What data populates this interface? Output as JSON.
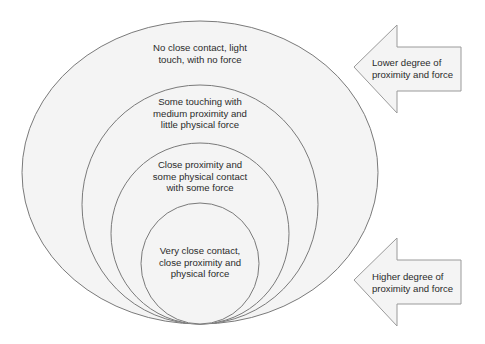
{
  "diagram": {
    "type": "nested-ellipses",
    "colors": {
      "fill": "#f3f3f3",
      "stroke": "#7a7a7a",
      "text": "#2b2b2b"
    },
    "rings": [
      {
        "label_lines": [
          "No close contact, light",
          "touch, with no force"
        ]
      },
      {
        "label_lines": [
          "Some touching with",
          "medium proximity and",
          "little physical force"
        ]
      },
      {
        "label_lines": [
          "Close proximity and",
          "some physical contact",
          "with some force"
        ]
      },
      {
        "label_lines": [
          "Very close contact,",
          "close proximity and",
          "physical force"
        ]
      }
    ],
    "arrows": [
      {
        "direction": "left",
        "label_lines": [
          "Lower degree of",
          "proximity and force"
        ]
      },
      {
        "direction": "left",
        "label_lines": [
          "Higher degree of",
          "proximity and force"
        ]
      }
    ]
  }
}
